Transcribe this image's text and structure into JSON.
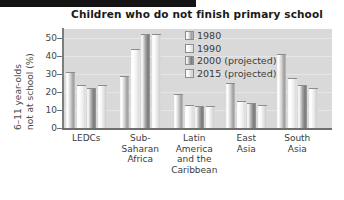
{
  "chart_data": {
    "type": "bar",
    "title": "Children who do not finish primary school",
    "xlabel": "",
    "ylabel": "6–11 year-olds not at school (%)",
    "ylabel_line1": "6–11 year-olds",
    "ylabel_line2": "not at school (%)",
    "ylim": [
      0,
      55
    ],
    "yticks": [
      0,
      10,
      20,
      30,
      40,
      50
    ],
    "ytick_labels": [
      "0",
      "10",
      "20",
      "30",
      "40",
      "50"
    ],
    "grid": true,
    "legend_position": "inside-top-right",
    "categories": [
      "LEDCs",
      "Sub-Saharan Africa",
      "Latin America and the Caribbean",
      "East Asia",
      "South Asia"
    ],
    "category_label_lines": [
      [
        "LEDCs"
      ],
      [
        "Sub-",
        "Saharan",
        "Africa"
      ],
      [
        "Latin",
        "America",
        "and the",
        "Caribbean"
      ],
      [
        "East",
        "Asia"
      ],
      [
        "South",
        "Asia"
      ]
    ],
    "series": [
      {
        "name": "1980",
        "values": [
          31,
          29,
          19,
          25,
          41
        ]
      },
      {
        "name": "1990",
        "values": [
          24,
          44,
          13,
          15,
          28
        ]
      },
      {
        "name": "2000 (projected)",
        "values": [
          22,
          52,
          12,
          14,
          24
        ]
      },
      {
        "name": "2015 (projected)",
        "values": [
          24,
          52,
          12,
          13,
          22
        ]
      }
    ]
  },
  "legend": {
    "items": [
      {
        "label": "1980"
      },
      {
        "label": "1990"
      },
      {
        "label": "2000 (projected)"
      },
      {
        "label": "2015 (projected)"
      }
    ]
  },
  "colors": {
    "plot_background": "#d9d9d9",
    "grid": "#e7e7e7",
    "axis": "#6f6f6f",
    "title_text": "#1a1a1a",
    "label_text": "#3b3b3b"
  }
}
